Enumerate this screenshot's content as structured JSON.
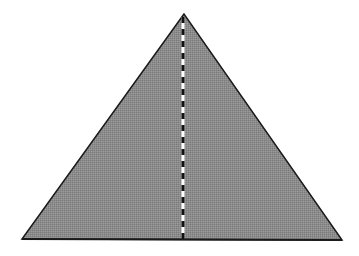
{
  "diagram": {
    "type": "triangle-with-altitude",
    "colors": {
      "fill": "#8c8c8c",
      "outline": "#1a1a1a",
      "dash_dark": "#111111",
      "dash_light": "#ffffff",
      "background": "#ffffff"
    },
    "triangle": {
      "apex": [
        184,
        14
      ],
      "base_left": [
        22,
        239
      ],
      "base_right": [
        342,
        240
      ]
    },
    "altitude": {
      "x": 183,
      "y_top": 17,
      "y_bottom": 240,
      "dash_length": 6
    }
  }
}
